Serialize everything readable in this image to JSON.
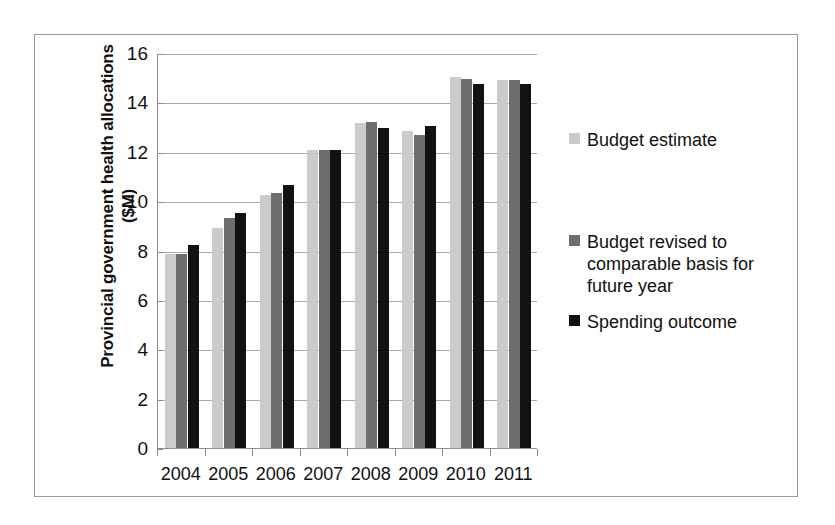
{
  "chart_data": {
    "type": "bar",
    "title": "",
    "xlabel": "",
    "ylabel": "Provincial government health allocations ($M)",
    "categories": [
      "2004",
      "2005",
      "2006",
      "2007",
      "2008",
      "2009",
      "2010",
      "2011"
    ],
    "ylim": [
      0,
      16
    ],
    "yticks": [
      0,
      2,
      4,
      6,
      8,
      10,
      12,
      14,
      16
    ],
    "ytick_labels": [
      "0",
      "2",
      "4",
      "6",
      "8",
      "10",
      "12",
      "14",
      "16"
    ],
    "grid": true,
    "legend_position": "right",
    "series": [
      {
        "name": "Budget estimate",
        "color": "#cbcbcb",
        "values": [
          7.9,
          8.95,
          10.3,
          12.1,
          13.2,
          12.9,
          15.05,
          14.95
        ]
      },
      {
        "name": "Budget revised to comparable basis for future year",
        "color": "#6e6e6e",
        "values": [
          7.9,
          9.35,
          10.35,
          12.1,
          13.25,
          12.7,
          15.0,
          14.95
        ]
      },
      {
        "name": "Spending outcome",
        "color": "#121212",
        "values": [
          8.25,
          9.55,
          10.7,
          12.1,
          13.0,
          13.1,
          14.8,
          14.8
        ]
      }
    ]
  },
  "legend": {
    "entries": [
      {
        "label": "Budget estimate",
        "swatch": "#cbcbcb"
      },
      {
        "label": "Budget revised to comparable basis for future year",
        "swatch": "#6e6e6e"
      },
      {
        "label": "Spending outcome",
        "swatch": "#121212"
      }
    ]
  }
}
